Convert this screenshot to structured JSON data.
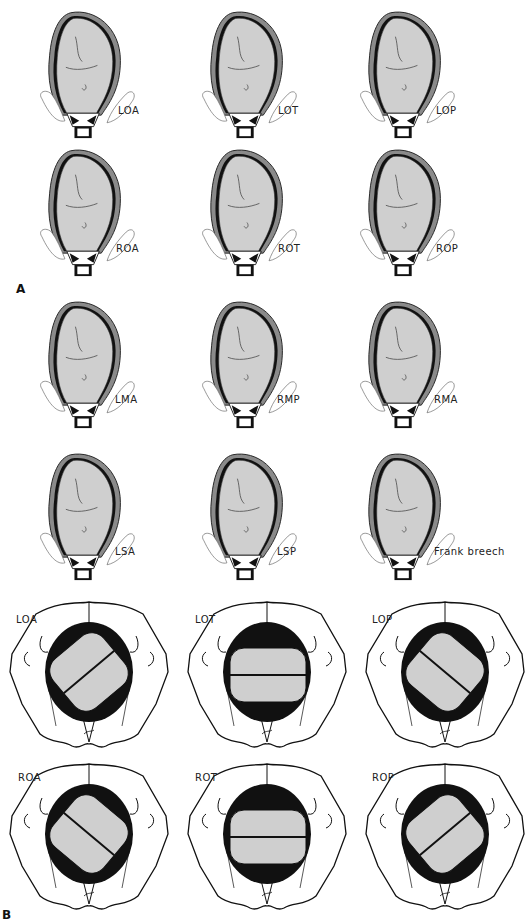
{
  "panel_a": {
    "label": "A",
    "figures": [
      {
        "label": "LOA"
      },
      {
        "label": "LOT"
      },
      {
        "label": "LOP"
      },
      {
        "label": "ROA"
      },
      {
        "label": "ROT"
      },
      {
        "label": "ROP"
      },
      {
        "label": "LMA"
      },
      {
        "label": "RMP"
      },
      {
        "label": "RMA"
      },
      {
        "label": "LSA"
      },
      {
        "label": "LSP"
      },
      {
        "label": "Frank breech"
      }
    ]
  },
  "panel_b": {
    "label": "B",
    "figures": [
      {
        "label": "LOA"
      },
      {
        "label": "LOT"
      },
      {
        "label": "LOP"
      },
      {
        "label": "ROA"
      },
      {
        "label": "ROT"
      },
      {
        "label": "ROP"
      }
    ]
  },
  "colors": {
    "fetus_fill": "#cfcfcf",
    "uterus_wall": "#8a8a8a",
    "ink": "#111111",
    "background": "#ffffff"
  }
}
